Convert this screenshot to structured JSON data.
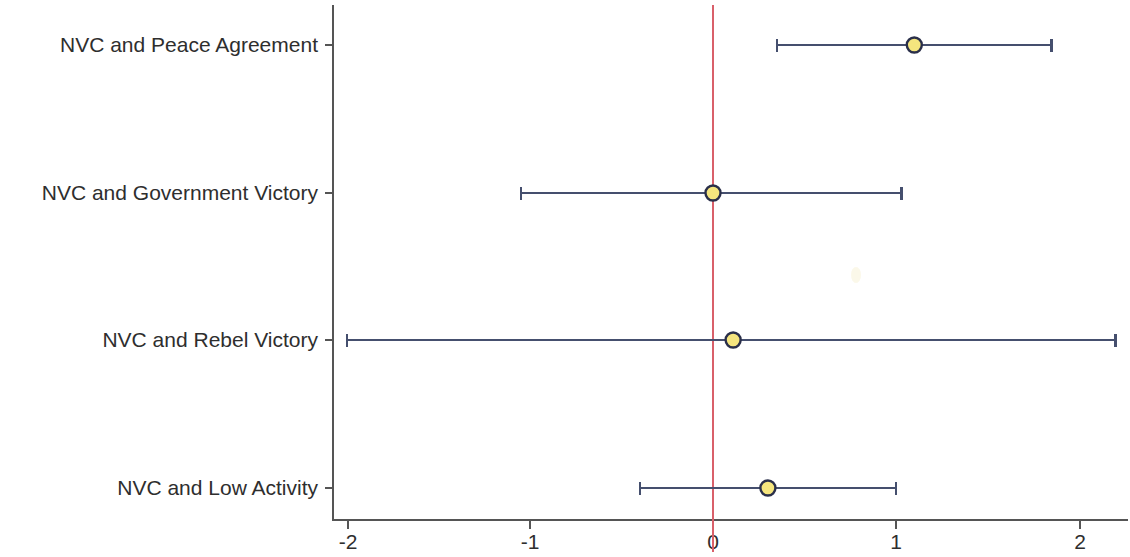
{
  "chart_data": {
    "type": "scatter",
    "subtype": "forest-plot",
    "title": "",
    "subtitle": "",
    "xlabel": "",
    "ylabel": "",
    "xlim": [
      -2.2,
      2.33
    ],
    "ylim": [
      0,
      4
    ],
    "grid": false,
    "legend": null,
    "reference_line": {
      "orientation": "vertical",
      "value": 0,
      "color": "#d9606a"
    },
    "xticks": [
      -2,
      -1,
      0,
      1,
      2
    ],
    "xtick_labels": [
      "-2",
      "-1",
      "0",
      "1",
      "2"
    ],
    "categories": [
      "NVC and Peace Agreement",
      "NVC and Government Victory",
      "NVC and Rebel Victory",
      "NVC and Low Activity"
    ],
    "values": [
      1.1,
      0.0,
      0.11,
      0.3
    ],
    "ci_low": [
      0.35,
      -1.05,
      -2.0,
      -0.4
    ],
    "ci_high": [
      1.85,
      1.03,
      2.2,
      1.0
    ],
    "points": [
      {
        "label": "NVC and Peace Agreement",
        "estimate": 1.1,
        "ci_low": 0.35,
        "ci_high": 1.85
      },
      {
        "label": "NVC and Government Victory",
        "estimate": 0.0,
        "ci_low": -1.05,
        "ci_high": 1.03
      },
      {
        "label": "NVC and Rebel Victory",
        "estimate": 0.11,
        "ci_low": -2.0,
        "ci_high": 2.2
      },
      {
        "label": "NVC and Low Activity",
        "estimate": 0.3,
        "ci_low": -0.4,
        "ci_high": 1.0
      }
    ],
    "marker_fill": "#f5e57e",
    "marker_edge": "#2a2f4a",
    "line_color": "#454f6e"
  },
  "axis": {
    "ytick_labels": [
      "NVC and Peace Agreement",
      "NVC and Government Victory",
      "NVC and Rebel Victory",
      "NVC and Low Activity"
    ],
    "xtick_labels": [
      "-2",
      "-1",
      "0",
      "1",
      "2"
    ]
  }
}
